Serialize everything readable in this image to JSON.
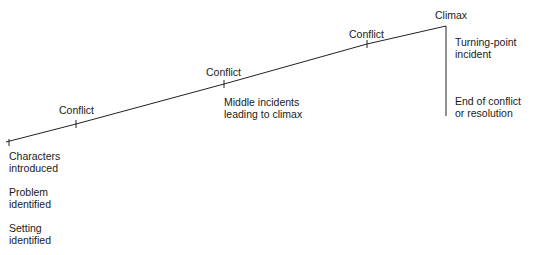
{
  "diagram": {
    "type": "plot-line",
    "stroke_color": "#222222",
    "start_labels": [
      {
        "line1": "Characters",
        "line2": "introduced"
      },
      {
        "line1": "Problem",
        "line2": "identified"
      },
      {
        "line1": "Setting",
        "line2": "identified"
      }
    ],
    "conflicts": [
      {
        "label": "Conflict"
      },
      {
        "label": "Conflict"
      },
      {
        "label": "Conflict"
      }
    ],
    "middle_label": {
      "line1": "Middle incidents",
      "line2": "leading to climax"
    },
    "climax_label": "Climax",
    "turning_point": {
      "line1": "Turning-point",
      "line2": "incident"
    },
    "resolution": {
      "line1": "End of conflict",
      "line2": "or resolution"
    }
  }
}
